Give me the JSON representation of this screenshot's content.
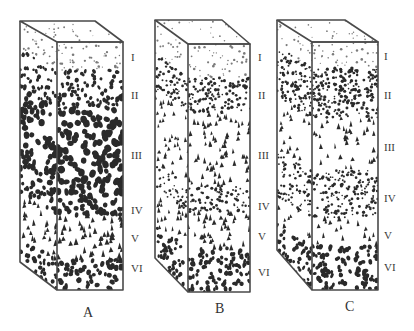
{
  "figure": {
    "type": "soil profile block diagrams",
    "colors": {
      "outline": "#4a4a4a",
      "particle": "#2a2a2a",
      "background": "#ffffff"
    }
  },
  "horizon_labels": [
    "I",
    "II",
    "III",
    "IV",
    "V",
    "VI"
  ],
  "columns": [
    {
      "label": "A",
      "label_pos": [
        83,
        306
      ],
      "box": {
        "back_left_x": 20,
        "back_right_x": 95,
        "front_left_x": 57,
        "front_right_x": 123,
        "top_back_y": 21,
        "top_front_y": 42,
        "bottom_left_y": 262,
        "bottom_front_y": 290
      },
      "label_x": 131,
      "label_ys": [
        52,
        90,
        150,
        205,
        233,
        263
      ],
      "layers": [
        {
          "name": "I",
          "y0": 42,
          "y1": 70,
          "density": 0.12,
          "shape": "dot",
          "size": 1.2
        },
        {
          "name": "II",
          "y0": 70,
          "y1": 110,
          "density": 0.45,
          "shape": "blob",
          "size": 2.0
        },
        {
          "name": "III",
          "y0": 110,
          "y1": 195,
          "density": 0.85,
          "shape": "blob",
          "size": 3.2
        },
        {
          "name": "IV",
          "y0": 195,
          "y1": 215,
          "density": 0.75,
          "shape": "blob",
          "size": 2.6
        },
        {
          "name": "V",
          "y0": 215,
          "y1": 260,
          "density": 0.95,
          "shape": "triangle",
          "size": 4.2
        },
        {
          "name": "VI",
          "y0": 260,
          "y1": 290,
          "density": 0.55,
          "shape": "blob",
          "size": 2.4
        }
      ]
    },
    {
      "label": "B",
      "label_pos": [
        215,
        302
      ],
      "box": {
        "back_left_x": 155,
        "back_right_x": 222,
        "front_left_x": 188,
        "front_right_x": 250,
        "top_back_y": 20,
        "top_front_y": 44,
        "bottom_left_y": 258,
        "bottom_front_y": 292
      },
      "label_x": 258,
      "label_ys": [
        52,
        90,
        150,
        201,
        231,
        267
      ],
      "layers": [
        {
          "name": "I",
          "y0": 44,
          "y1": 78,
          "density": 0.1,
          "shape": "dot",
          "size": 1.2
        },
        {
          "name": "II",
          "y0": 78,
          "y1": 112,
          "density": 0.5,
          "shape": "dot",
          "size": 1.6
        },
        {
          "name": "III",
          "y0": 112,
          "y1": 185,
          "density": 0.65,
          "shape": "triangle",
          "size": 3.6
        },
        {
          "name": "IV",
          "y0": 185,
          "y1": 212,
          "density": 0.35,
          "shape": "dot",
          "size": 1.5
        },
        {
          "name": "V",
          "y0": 212,
          "y1": 248,
          "density": 0.8,
          "shape": "triangle",
          "size": 3.8
        },
        {
          "name": "VI",
          "y0": 248,
          "y1": 292,
          "density": 0.55,
          "shape": "blob",
          "size": 2.2
        }
      ]
    },
    {
      "label": "C",
      "label_pos": [
        345,
        300
      ],
      "box": {
        "back_left_x": 277,
        "back_right_x": 345,
        "front_left_x": 312,
        "front_right_x": 378,
        "top_back_y": 20,
        "top_front_y": 42,
        "bottom_left_y": 250,
        "bottom_front_y": 290
      },
      "label_x": 384,
      "label_ys": [
        51,
        90,
        142,
        193,
        230,
        262
      ],
      "layers": [
        {
          "name": "I",
          "y0": 42,
          "y1": 68,
          "density": 0.1,
          "shape": "dot",
          "size": 1.2
        },
        {
          "name": "II",
          "y0": 68,
          "y1": 118,
          "density": 0.55,
          "shape": "dot",
          "size": 1.6
        },
        {
          "name": "III",
          "y0": 118,
          "y1": 170,
          "density": 0.45,
          "shape": "triangle",
          "size": 3.6
        },
        {
          "name": "IV",
          "y0": 170,
          "y1": 218,
          "density": 0.4,
          "shape": "dot",
          "size": 1.5
        },
        {
          "name": "V",
          "y0": 218,
          "y1": 245,
          "density": 0.45,
          "shape": "triangle",
          "size": 3.8
        },
        {
          "name": "VI",
          "y0": 245,
          "y1": 290,
          "density": 0.55,
          "shape": "blob",
          "size": 2.2
        }
      ]
    }
  ]
}
